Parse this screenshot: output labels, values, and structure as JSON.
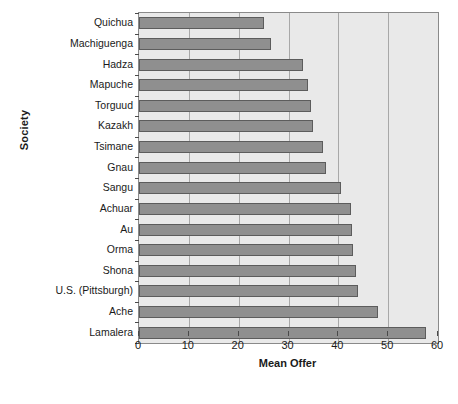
{
  "chart_data": {
    "type": "bar",
    "orientation": "horizontal",
    "title": "",
    "xlabel": "Mean Offer",
    "ylabel": "Society",
    "xlim": [
      0,
      60
    ],
    "xticks": [
      0,
      10,
      20,
      30,
      40,
      50,
      60
    ],
    "grid": "vertical",
    "legend": "none",
    "categories": [
      "Quichua",
      "Machiguenga",
      "Hadza",
      "Mapuche",
      "Torguud",
      "Kazakh",
      "Tsimane",
      "Gnau",
      "Sangu",
      "Achuar",
      "Au",
      "Orma",
      "Shona",
      "U.S. (Pittsburgh)",
      "Ache",
      "Lamalera"
    ],
    "values": [
      25,
      26.5,
      33,
      34,
      34.6,
      35,
      37,
      37.5,
      40.5,
      42.5,
      42.7,
      43,
      43.5,
      44,
      48,
      57.5
    ],
    "bar_color": "#8f8f8f",
    "bar_edge_color": "#5c5c5c",
    "plot_background": "#e9e9e9",
    "gridline_color": "#a8a8a8"
  },
  "caption": ""
}
